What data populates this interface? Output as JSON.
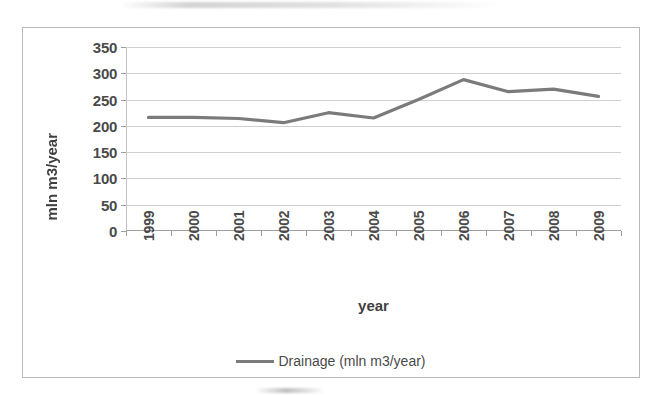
{
  "chart_data": {
    "type": "line",
    "title": "",
    "subtitle": "",
    "xlabel": "year",
    "ylabel": "mln m3/year",
    "grid": true,
    "legend_position": "bottom",
    "xlim_categories": [
      "1999",
      "2000",
      "2001",
      "2002",
      "2003",
      "2004",
      "2005",
      "2006",
      "2007",
      "2008",
      "2009"
    ],
    "ylim": [
      0,
      350
    ],
    "ytick_step": 50,
    "yticks": [
      0,
      50,
      100,
      150,
      200,
      250,
      300,
      350
    ],
    "ytick_labels": [
      "0",
      "50",
      "100",
      "150",
      "200",
      "250",
      "300",
      "350"
    ],
    "categories": [
      "1999",
      "2000",
      "2001",
      "2002",
      "2003",
      "2004",
      "2005",
      "2006",
      "2007",
      "2008",
      "2009"
    ],
    "series": [
      {
        "name": "Drainage (mln m3/year)",
        "color": "#7b7b7b",
        "values": [
          216,
          216,
          214,
          206,
          225,
          215,
          250,
          288,
          265,
          270,
          256
        ]
      }
    ]
  },
  "legend": {
    "entries": [
      {
        "label": "Drainage (mln m3/year)",
        "color": "#7b7b7b",
        "marker": "line-swatch"
      }
    ]
  },
  "axes": {
    "y": {
      "title": "mln m3/year",
      "tick_labels": [
        "350",
        "300",
        "250",
        "200",
        "150",
        "100",
        "50",
        "0"
      ]
    },
    "x": {
      "title": "year",
      "tick_labels": [
        "1999",
        "2000",
        "2001",
        "2002",
        "2003",
        "2004",
        "2005",
        "2006",
        "2007",
        "2008",
        "2009"
      ]
    }
  },
  "colors": {
    "series_line": "#7b7b7b",
    "gridline": "#cfcfcf",
    "axis": "#9e9e9e",
    "frame": "#b9b9b9",
    "text": "#4a4a4a",
    "background": "#ffffff"
  }
}
